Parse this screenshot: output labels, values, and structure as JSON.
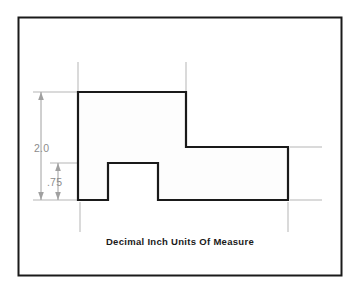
{
  "figure": {
    "caption": "Decimal Inch Units Of Measure",
    "border_color": "#1a1a1a",
    "background_color": "#ffffff"
  },
  "part": {
    "name": "stepped-block-profile",
    "outline_color": "#1a1a1a",
    "fill_color": "#fdfdfd",
    "vertices": [
      [
        78,
        92
      ],
      [
        186,
        92
      ],
      [
        186,
        147
      ],
      [
        288,
        147
      ],
      [
        288,
        200
      ],
      [
        158,
        200
      ],
      [
        158,
        163
      ],
      [
        108,
        163
      ],
      [
        108,
        200
      ],
      [
        78,
        200
      ]
    ]
  },
  "dimensions": {
    "color": "#8c8c8c",
    "overall_height": {
      "label": "2.0",
      "value": 2.0,
      "units": "inch",
      "orientation": "vertical",
      "from_y": 92,
      "to_y": 200,
      "line_x": 41,
      "label_x": 34,
      "label_y": 152
    },
    "step_height": {
      "label": ".75",
      "value": 0.75,
      "units": "inch",
      "orientation": "vertical",
      "from_y": 163,
      "to_y": 200,
      "line_x": 58,
      "label_x": 49,
      "label_y": 186
    }
  },
  "extension_lines": {
    "color": "#b5b5b5",
    "vertical": [
      {
        "x": 78,
        "y1": 62,
        "y2": 92
      },
      {
        "x": 186,
        "y1": 62,
        "y2": 92
      },
      {
        "x": 80,
        "y1": 202,
        "y2": 232
      },
      {
        "x": 288,
        "y1": 202,
        "y2": 232
      }
    ],
    "horizontal": [
      {
        "y": 92,
        "x1": 33,
        "x2": 78
      },
      {
        "y": 163,
        "x1": 50,
        "x2": 108
      },
      {
        "y": 200,
        "x1": 33,
        "x2": 78
      },
      {
        "y": 147,
        "x1": 290,
        "x2": 322
      },
      {
        "y": 200,
        "x1": 290,
        "x2": 322
      }
    ]
  }
}
